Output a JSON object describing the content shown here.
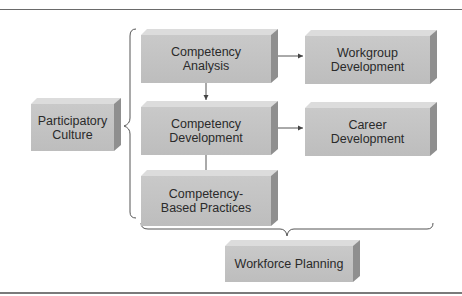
{
  "diagram": {
    "boxes": [
      {
        "id": "participatory-culture",
        "lines": [
          "Participatory",
          "Culture"
        ],
        "x": 31,
        "y": 98,
        "w": 83,
        "h": 47
      },
      {
        "id": "competency-analysis",
        "lines": [
          "Competency",
          "Analysis"
        ],
        "x": 141,
        "y": 29,
        "w": 130,
        "h": 48
      },
      {
        "id": "competency-development",
        "lines": [
          "Competency",
          "Development"
        ],
        "x": 141,
        "y": 101,
        "w": 130,
        "h": 48
      },
      {
        "id": "competency-based-practices",
        "lines": [
          "Competency-",
          "Based Practices"
        ],
        "x": 141,
        "y": 170,
        "w": 130,
        "h": 50
      },
      {
        "id": "workgroup-development",
        "lines": [
          "Workgroup",
          "Development"
        ],
        "x": 305,
        "y": 30,
        "w": 125,
        "h": 48
      },
      {
        "id": "career-development",
        "lines": [
          "Career",
          "Development"
        ],
        "x": 305,
        "y": 102,
        "w": 125,
        "h": 48
      },
      {
        "id": "workforce-planning",
        "lines": [
          "Workforce Planning"
        ],
        "x": 225,
        "y": 240,
        "w": 128,
        "h": 36
      }
    ],
    "connectors": [
      {
        "from": "competency-analysis",
        "to": "competency-development",
        "type": "arrow-down"
      },
      {
        "from": "competency-based-practices",
        "to": "competency-development",
        "type": "arrow-up"
      },
      {
        "from": "competency-analysis",
        "to": "workgroup-development",
        "type": "arrow-right"
      },
      {
        "from": "competency-development",
        "to": "career-development",
        "type": "arrow-right"
      }
    ],
    "braces": [
      {
        "id": "vertical-brace",
        "orientation": "left",
        "groups": "competency boxes",
        "points_to": "participatory-culture"
      },
      {
        "id": "horizontal-brace",
        "orientation": "down",
        "groups": "all boxes",
        "points_to": "workforce-planning"
      }
    ],
    "colors": {
      "box_front": "#c4c4c4",
      "box_top": "#dcdcdc",
      "box_side": "#8f8f8f",
      "line": "#555555",
      "text": "#2a2a2a"
    }
  }
}
